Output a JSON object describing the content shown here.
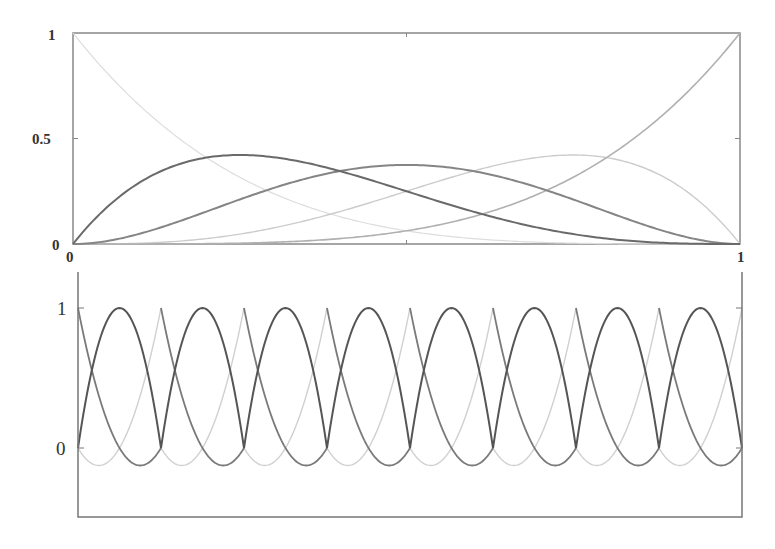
{
  "chart_data": [
    {
      "type": "line",
      "title": "",
      "description": "Bernstein basis polynomials of degree 4 on [0,1]",
      "xlabel": "",
      "ylabel": "",
      "xlim": [
        0,
        1
      ],
      "ylim": [
        0,
        1
      ],
      "grid": false,
      "legend": "none",
      "x_ticks": [
        {
          "value": 0,
          "label": "0"
        },
        {
          "value": 0.5,
          "label": "0.5"
        },
        {
          "value": 1,
          "label": "1"
        }
      ],
      "y_ticks": [
        {
          "value": 0,
          "label": "0"
        },
        {
          "value": 0.5,
          "label": "0.5"
        },
        {
          "value": 1,
          "label": "1"
        }
      ],
      "x": [
        0,
        0.125,
        0.25,
        0.375,
        0.5,
        0.625,
        0.75,
        0.875,
        1
      ],
      "series": [
        {
          "name": "B0,4 = (1-t)^4",
          "color": "#dddddd",
          "width": 1.2,
          "values": [
            1,
            0.586,
            0.316,
            0.153,
            0.0625,
            0.02,
            0.0039,
            0.0002,
            0
          ]
        },
        {
          "name": "B1,4 = 4t(1-t)^3",
          "color": "#6a6a6a",
          "width": 2,
          "values": [
            0,
            0.335,
            0.422,
            0.366,
            0.25,
            0.132,
            0.047,
            0.007,
            0
          ]
        },
        {
          "name": "B2,4 = 6t^2(1-t)^2",
          "color": "#858585",
          "width": 2,
          "values": [
            0,
            0.072,
            0.211,
            0.33,
            0.375,
            0.33,
            0.211,
            0.072,
            0
          ]
        },
        {
          "name": "B3,4 = 4t^3(1-t)",
          "color": "#cccccc",
          "width": 1.4,
          "values": [
            0,
            0.007,
            0.047,
            0.132,
            0.25,
            0.366,
            0.422,
            0.335,
            0
          ]
        },
        {
          "name": "B4,4 = t^4",
          "color": "#b0b0b0",
          "width": 1.6,
          "values": [
            0,
            0.0002,
            0.0039,
            0.02,
            0.0625,
            0.153,
            0.316,
            0.586,
            1
          ]
        }
      ]
    },
    {
      "type": "line",
      "title": "",
      "description": "Piecewise quadratic Lagrange basis functions on 8 uniform elements",
      "xlabel": "",
      "ylabel": "",
      "elements": 8,
      "xlim": [
        0,
        8
      ],
      "ylim": [
        -0.55,
        1.25
      ],
      "grid": false,
      "legend": "none",
      "y_ticks": [
        {
          "value": 0,
          "label": "0"
        },
        {
          "value": 1,
          "label": "1"
        }
      ],
      "x_ticks": [],
      "local_x": [
        0,
        0.25,
        0.5,
        0.75,
        1
      ],
      "series": [
        {
          "name": "midpoint node 4t(1-t)",
          "color": "#555555",
          "width": 2,
          "values": [
            0,
            0.75,
            1,
            0.75,
            0
          ]
        },
        {
          "name": "left node (1-t)(1-2t)",
          "color": "#7a7a7a",
          "width": 1.8,
          "values": [
            1,
            0.375,
            0,
            -0.125,
            0
          ]
        },
        {
          "name": "right node t(2t-1)",
          "color": "#d0d0d0",
          "width": 1.4,
          "values": [
            0,
            -0.125,
            0,
            0.375,
            1
          ]
        }
      ]
    }
  ],
  "panels": {
    "top": {
      "y_labels": [
        "1",
        "0.5",
        "0"
      ],
      "x_labels": [
        "0",
        "0.5",
        "1"
      ]
    },
    "bottom": {
      "y_labels": [
        "1",
        "0"
      ]
    }
  }
}
